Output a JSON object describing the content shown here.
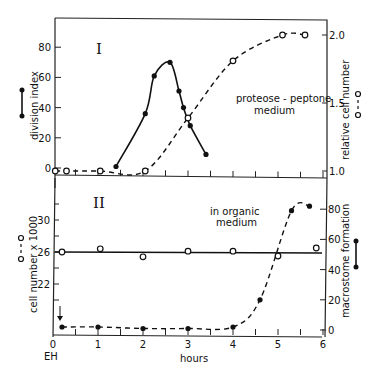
{
  "chart_data": [
    {
      "type": "line",
      "panel": "I",
      "annotation": "proteose - peptone medium",
      "xlabel": "hours",
      "xlim": [
        0,
        6
      ],
      "ylabel_left": "division index",
      "ylim_left": [
        0,
        80
      ],
      "yticks_left": [
        "0",
        "20",
        "40",
        "60",
        "80"
      ],
      "ylabel_right": "relative cell number",
      "ylim_right": [
        1.0,
        2.0
      ],
      "yticks_right": [
        "1.0",
        "1.5",
        "2.0"
      ],
      "series": [
        {
          "name": "division index",
          "marker": "filled circle",
          "line": "solid",
          "axis": "left",
          "x": [
            1.4,
            2.05,
            2.25,
            2.6,
            2.8,
            2.9,
            3.05,
            3.4
          ],
          "y": [
            1,
            36,
            61,
            70,
            51,
            40,
            28,
            9
          ]
        },
        {
          "name": "relative cell number",
          "marker": "open circle",
          "line": "dashed",
          "axis": "right",
          "x": [
            0.05,
            0.3,
            1.05,
            2.05,
            3.0,
            4.0,
            5.1,
            5.6
          ],
          "y": [
            1.0,
            1.0,
            1.0,
            1.0,
            1.39,
            1.81,
            2.0,
            2.0
          ]
        }
      ]
    },
    {
      "type": "line",
      "panel": "II",
      "annotation": "in organic medium",
      "xlabel": "hours",
      "xlim": [
        0,
        6
      ],
      "xticks": [
        "0",
        "1",
        "2",
        "3",
        "4",
        "5",
        "6"
      ],
      "x_origin_label": "EH",
      "ylabel_left": "cell number x 1000",
      "yticks_left": [
        "22",
        "26",
        "30"
      ],
      "ylabel_right": "macrostome formation",
      "ylim_right": [
        0,
        80
      ],
      "yticks_right": [
        "0",
        "20",
        "40",
        "60",
        "80"
      ],
      "series": [
        {
          "name": "cell number x 1000",
          "marker": "open circle",
          "line": "solid (flat fit at ~26)",
          "axis": "left",
          "x": [
            0.2,
            1.05,
            2.0,
            3.0,
            4.0,
            5.0,
            5.85
          ],
          "y": [
            26.0,
            26.4,
            25.4,
            26.1,
            26.1,
            25.5,
            26.5
          ]
        },
        {
          "name": "macrostome formation",
          "marker": "filled circle",
          "line": "dashed",
          "axis": "right",
          "x": [
            0.2,
            1.0,
            2.0,
            3.0,
            4.0,
            4.6,
            5.3,
            5.7
          ],
          "y": [
            2,
            2,
            1,
            1,
            2,
            20,
            79,
            82
          ]
        }
      ]
    }
  ],
  "labels": {
    "panel1": "I",
    "panel2": "II",
    "p1_left_axis": "division index",
    "p1_right_axis": "relative cell number",
    "p1_annotation_line1": "proteose - peptone",
    "p1_annotation_line2": "medium",
    "p2_left_axis": "cell number x 1000",
    "p2_right_axis": "macrostome formation",
    "p2_annotation_line1": "in organic",
    "p2_annotation_line2": "medium",
    "xlabel": "hours",
    "origin": "EH",
    "p1_left_ticks": [
      "0",
      "20",
      "40",
      "60",
      "80"
    ],
    "p1_right_ticks": [
      "1.0",
      "1.5",
      "2.0"
    ],
    "p2_left_ticks": [
      "22",
      "26",
      "30"
    ],
    "p2_right_ticks": [
      "0",
      "20",
      "40",
      "60",
      "80"
    ],
    "x_ticks": [
      "0",
      "1",
      "2",
      "3",
      "4",
      "5",
      "6"
    ]
  }
}
